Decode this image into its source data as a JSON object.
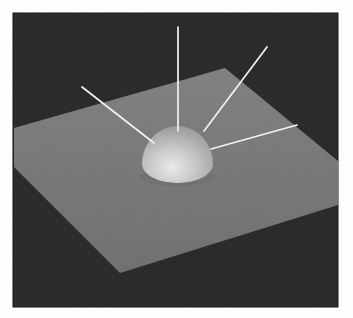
{
  "figure": {
    "page_background": "#fdfdfd",
    "frame": {
      "x": 13,
      "y": 13,
      "width": 325,
      "height": 294,
      "fill": "#2a2a2a",
      "edge_color": "#171717"
    },
    "plane": {
      "points": "225,68 338,161 338,205 120,273 14,167 14,128",
      "fill_top": "#7e7e7e",
      "fill_bottom": "#6e6e6e"
    },
    "dome": {
      "path": "M 142,164 A 35.5,38 0 0 1 213,164 A 35.5,19 0 0 1 142,164 Z",
      "highlight_color": "#e9e9e9",
      "mid_color": "#c9c9c9",
      "upper_color": "#a8a8a8",
      "rim_color": "#919191"
    },
    "shadow": {
      "cx": 177.5,
      "cy": 177,
      "rx": 38,
      "ry": 9,
      "fill": "#696969",
      "opacity": 0.55
    },
    "rays": {
      "color": "#f2f2f2",
      "stroke_width": 1.7,
      "segments": [
        {
          "name": "ray-up-left",
          "x1": 82,
          "y1": 87,
          "x2": 154,
          "y2": 143
        },
        {
          "name": "ray-vertical",
          "x1": 178,
          "y1": 27,
          "x2": 178,
          "y2": 131
        },
        {
          "name": "ray-up-right",
          "x1": 267,
          "y1": 47,
          "x2": 204,
          "y2": 131
        },
        {
          "name": "ray-horizontal",
          "x1": 297,
          "y1": 125,
          "x2": 211,
          "y2": 149
        }
      ]
    },
    "grain_opacity": 0.09
  }
}
